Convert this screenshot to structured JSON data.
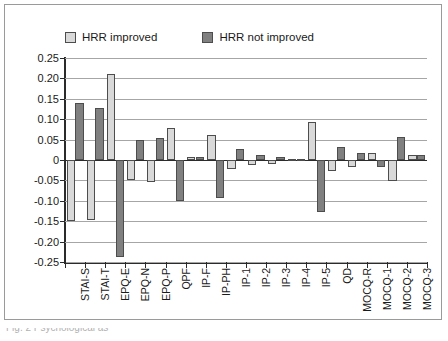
{
  "figure": {
    "caption_fragment": "Fig. 2    Psychological    as"
  },
  "chart_data": {
    "type": "bar",
    "title": "",
    "xlabel": "",
    "ylabel": "",
    "ylim": [
      -0.25,
      0.25
    ],
    "ytick_values": [
      0.25,
      0.2,
      0.15,
      0.1,
      0.05,
      0,
      -0.05,
      -0.1,
      -0.15,
      -0.2,
      -0.25
    ],
    "ytick_labels": [
      "0.25",
      "0.20",
      "0.15",
      "0.10",
      "0.05",
      "0",
      "-0.05",
      "-0.10",
      "-0.15",
      "-0.20",
      "-0.25"
    ],
    "grid": true,
    "legend_position": "top-left",
    "categories": [
      "STAI-S",
      "STAI-T",
      "EPQ-E",
      "EPQ-N",
      "EPQ-P",
      "QPF",
      "IP-F",
      "IP-PH",
      "IP-1",
      "IP-2",
      "IP-3",
      "IP-4",
      "IP-5",
      "QD",
      "MOCQ-R",
      "MOCQ-1",
      "MOCQ-2",
      "MOCQ-3"
    ],
    "series": [
      {
        "name": "HRR improved",
        "color": "#d9d9d9",
        "values": [
          -0.15,
          -0.147,
          0.211,
          -0.05,
          -0.055,
          0.079,
          0.007,
          0.062,
          -0.023,
          -0.013,
          -0.011,
          0.002,
          0.094,
          -0.028,
          -0.017,
          0.016,
          -0.051,
          0.012
        ]
      },
      {
        "name": "HRR not improved",
        "color": "#808080",
        "values": [
          0.139,
          0.127,
          -0.237,
          0.049,
          0.053,
          -0.101,
          0.007,
          -0.093,
          0.026,
          0.012,
          0.007,
          0.002,
          -0.128,
          0.033,
          0.016,
          -0.017,
          0.057,
          0.012
        ]
      }
    ]
  },
  "legend": {
    "items": [
      {
        "label": "HRR improved",
        "swatch": "#d9d9d9"
      },
      {
        "label": "HRR not improved",
        "swatch": "#808080"
      }
    ]
  }
}
